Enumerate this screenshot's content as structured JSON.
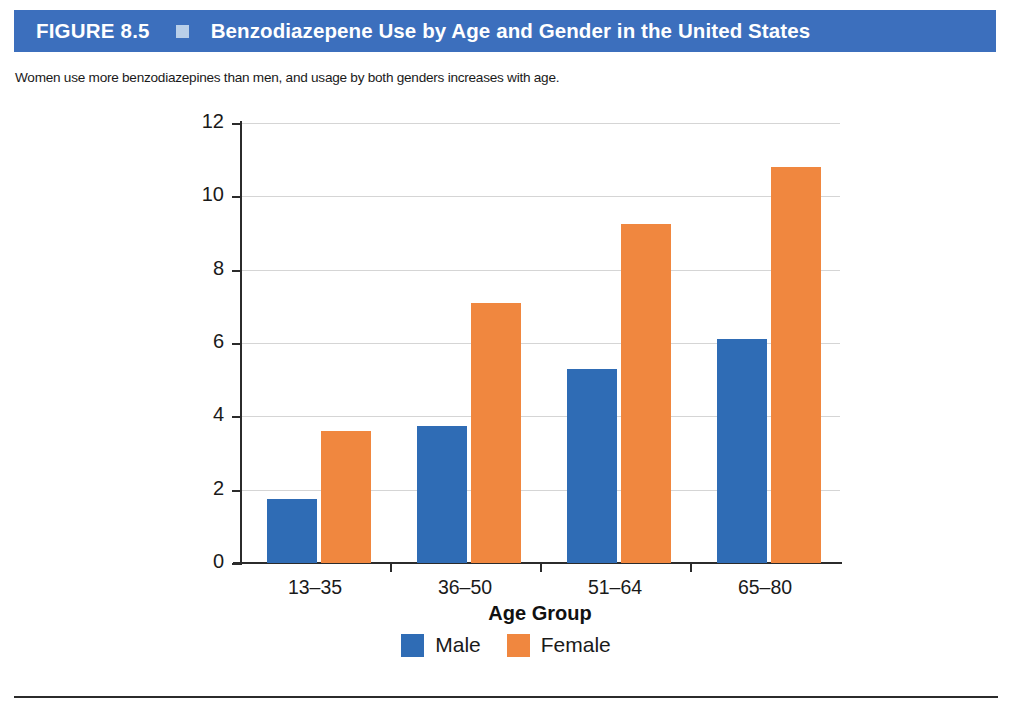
{
  "header": {
    "figure_number": "FIGURE 8.5",
    "marker_icon": "square-marker-icon",
    "title": "Benzodiazepene Use by Age and Gender in the United States",
    "bar_color": "#3c6fbd",
    "marker_color": "#b9cfe9",
    "text_color": "#ffffff"
  },
  "caption": {
    "text": "Women use more benzodiazepines than men, and usage by both genders increases with age."
  },
  "chart_data": {
    "type": "bar",
    "title": "Benzodiazepene Use by Age and Gender in the United States",
    "subtitle": "Women use more benzodiazepines than men, and usage by both genders increases with age.",
    "categories": [
      "13–35",
      "36–50",
      "51–64",
      "65–80"
    ],
    "series": [
      {
        "name": "Male",
        "color": "#2f6cb5",
        "values": [
          1.75,
          3.75,
          5.3,
          6.1
        ]
      },
      {
        "name": "Female",
        "color": "#f0873f",
        "values": [
          3.6,
          7.1,
          9.25,
          10.8
        ]
      }
    ],
    "xlabel": "Age Group",
    "ylabel": "Benzodiazepine Use (%)",
    "ylim": [
      0,
      12
    ],
    "yticks": [
      0,
      2,
      4,
      6,
      8,
      10,
      12
    ],
    "ytick_labels": [
      "0",
      "2",
      "4",
      "6",
      "8",
      "10",
      "12"
    ],
    "grid": true,
    "grid_axis": "y",
    "legend_position": "bottom-center",
    "legend": [
      "Male",
      "Female"
    ]
  },
  "legend": {
    "items": [
      {
        "label": "Male",
        "swatch": "male-color-swatch"
      },
      {
        "label": "Female",
        "swatch": "female-color-swatch"
      }
    ]
  }
}
